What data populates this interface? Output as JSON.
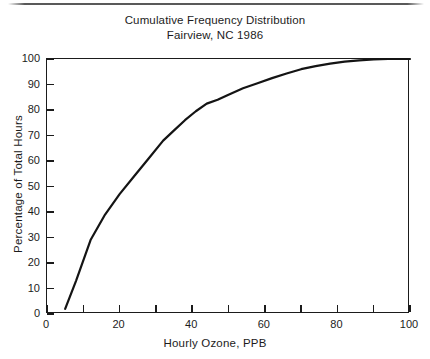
{
  "figure": {
    "title_lines": [
      "Cumulative Frequency Distribution",
      "Fairview, NC 1986"
    ]
  },
  "chart_data": {
    "type": "line",
    "title": "Cumulative Frequency Distribution",
    "subtitle": "Fairview, NC 1986",
    "xlabel": "Hourly Ozone, PPB",
    "ylabel": "Percentage of Total Hours",
    "xlim": [
      0,
      100
    ],
    "ylim": [
      0,
      100
    ],
    "xticks": [
      0,
      10,
      20,
      30,
      40,
      50,
      60,
      70,
      80,
      90,
      100
    ],
    "xtick_labels": [
      "0",
      "",
      "20",
      "",
      "40",
      "",
      "60",
      "",
      "80",
      "",
      "100"
    ],
    "yticks": [
      0,
      10,
      20,
      30,
      40,
      50,
      60,
      70,
      80,
      90,
      100
    ],
    "ytick_labels": [
      "0",
      "10",
      "20",
      "30",
      "40",
      "50",
      "60",
      "70",
      "80",
      "90",
      "100"
    ],
    "grid": false,
    "legend": null,
    "line_color": "#141414",
    "line_width": 2.2,
    "series": [
      {
        "name": "Cumulative frequency",
        "x": [
          5,
          8,
          12,
          16,
          20,
          24,
          28,
          32,
          35,
          38,
          41,
          44,
          47,
          50,
          54,
          58,
          62,
          66,
          70,
          74,
          78,
          82,
          86,
          90,
          94,
          100
        ],
        "y": [
          2,
          13,
          29,
          39,
          47,
          54,
          61,
          68,
          72,
          76,
          79.5,
          82.5,
          84,
          86,
          88.5,
          90.5,
          92.5,
          94.3,
          96,
          97.2,
          98.2,
          99,
          99.5,
          99.8,
          100,
          100
        ]
      }
    ]
  }
}
